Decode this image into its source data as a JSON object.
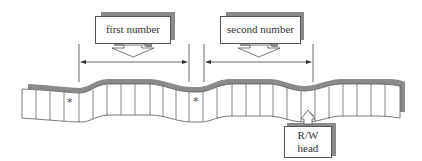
{
  "diagram": {
    "type": "turing-machine-tape",
    "labels": {
      "first_number": "first number",
      "second_number": "second number",
      "head_line1": "R/W",
      "head_line2": "head"
    },
    "separators": [
      "*",
      "*"
    ],
    "colors": {
      "line": "#555555",
      "shadow": "#8a8a8a",
      "background": "#ffffff"
    }
  }
}
